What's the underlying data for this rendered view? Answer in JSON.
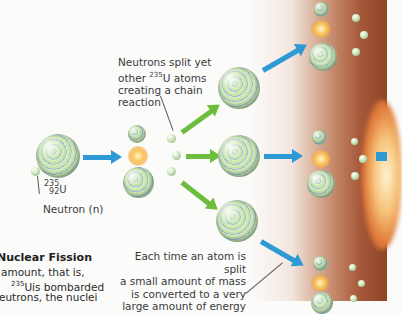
{
  "diagram": {
    "title_partial": "Nuclear Fission",
    "isotope": {
      "mass_number": "235",
      "atomic_number": "92",
      "symbol": "U"
    },
    "labels": {
      "neutron": "Neutron (n)",
      "chain_reaction": [
        "Neutrons split yet",
        "other ",
        "U atoms",
        "creating a chain",
        "reaction"
      ],
      "chain_reaction_sup": "235",
      "energy": [
        "Each time an atom is split",
        "a small amount of mass",
        "is converted to a very",
        "large amount of energy"
      ]
    },
    "body_text": {
      "line1": "amount, that is,",
      "line2_sup": "235",
      "line2": "Uis bombarded",
      "line3": "eutrons, the nuclei"
    },
    "colors": {
      "blue_arrow": "#2d9ad6",
      "green_arrow": "#6cbd3c",
      "background_glow": "#a6593a"
    }
  }
}
